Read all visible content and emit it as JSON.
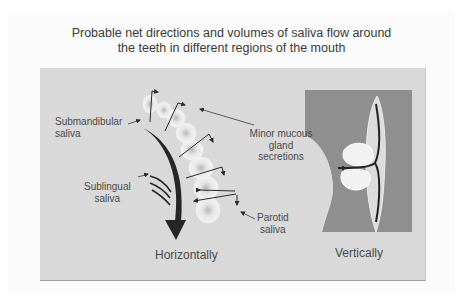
{
  "title": {
    "line1": "Probable net directions and volumes of saliva flow around",
    "line2": "the teeth in different regions of the mouth"
  },
  "labels": {
    "submandibular": {
      "line1": "Submandibular",
      "line2": "saliva"
    },
    "sublingual": {
      "line1": "Sublingual",
      "line2": "saliva"
    },
    "parotid": {
      "line1": "Parotid",
      "line2": "saliva"
    },
    "minor_mucous": {
      "line1": "Minor mucous",
      "line2": "gland",
      "line3": "secretions"
    }
  },
  "captions": {
    "horizontal": "Horizontally",
    "vertical": "Vertically"
  },
  "colors": {
    "background": "#ffffff",
    "panel": "#d9d9d9",
    "mouth_dark": "#8f8f8f",
    "tooth": "#f2f2f2",
    "arrow": "#2a2a2a",
    "text": "#4a4a4a"
  }
}
